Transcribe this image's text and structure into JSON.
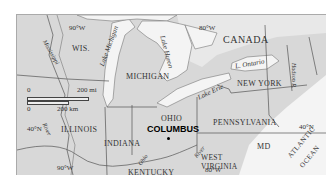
{
  "map": {
    "states": [
      "WIS.",
      "MICHIGAN",
      "ILLINOIS",
      "INDIANA",
      "OHIO",
      "KENTUCKY",
      "WEST VIRGINIA",
      "PENNSYLVANIA",
      "NEW YORK",
      "MD"
    ],
    "country": "CANADA",
    "city": "COLUMBUS",
    "water": {
      "lake_michigan": "Lake Michigan",
      "lake_huron": "Lake Huron",
      "lake_erie": "Lake Erie",
      "lake_ontario": "L. Ontario",
      "mississippi": "Mississippi",
      "ohio_river1": "Ohio",
      "ohio_river2": "River",
      "river_il": "River",
      "hudson": "Hudson R.",
      "ocean1": "ATLANTIC",
      "ocean2": "OCEAN"
    },
    "grid": {
      "lon90_top": "90°W",
      "lon80_top": "80°W",
      "lat40_left": "40°N",
      "lat40_right": "40°N",
      "lon90_bottom": "90°W",
      "lon80_bottom": "80°W"
    },
    "scale": {
      "zero_top": "0",
      "mi": "200 mi",
      "zero_bottom": "0",
      "km": "200 km"
    },
    "colors": {
      "land": "#d8d8d8",
      "water": "#f4f4f4",
      "border": "#555555"
    }
  }
}
